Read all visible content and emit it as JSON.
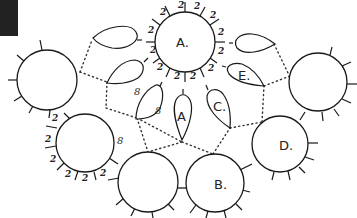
{
  "diagram": {
    "type": "tatting pattern diagram",
    "corner_block": {
      "color": "#222222"
    },
    "labels": {
      "ring_a": "A.",
      "ring_b": "B.",
      "ring_d": "D.",
      "chain_a": "A",
      "chain_c": "C.",
      "chain_e": "E."
    },
    "stitch_counts": {
      "ring_a": [
        "2",
        "2",
        "2",
        "2",
        "2",
        "2",
        "2",
        "2",
        "2",
        "2",
        "2",
        "2",
        "2"
      ],
      "ring_bottom_left": [
        "2",
        "2",
        "2",
        "2",
        "2",
        "2"
      ],
      "ring_bottom_left_join": "8",
      "chain_left": [
        "8",
        "8"
      ]
    },
    "elements": {
      "rings": [
        "ring-a",
        "ring-left",
        "ring-bottom-left",
        "ring-bottom-middle",
        "ring-b",
        "ring-d",
        "ring-right"
      ],
      "chains": [
        "chain-top-left",
        "chain-left",
        "chain-8",
        "chain-a",
        "chain-c",
        "chain-e",
        "chain-top-right"
      ]
    }
  }
}
